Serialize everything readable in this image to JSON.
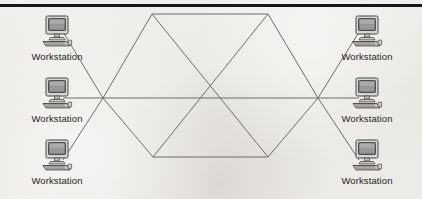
{
  "diagram": {
    "topology_type": "mesh",
    "background_color": "#eceae6",
    "line_color": "#6e6c6a",
    "rule_color": "#17171a",
    "label_color": "#1d1d20",
    "icon_name": "workstation-computer-icon",
    "nodes": [
      {
        "id": "ws-top-left",
        "label": "Workstation",
        "x": 20,
        "y": 14,
        "port_x": 63,
        "port_y": 32
      },
      {
        "id": "ws-middle-left",
        "label": "Workstation",
        "x": 20,
        "y": 76,
        "port_x": 63,
        "port_y": 98
      },
      {
        "id": "ws-bottom-left",
        "label": "Workstation",
        "x": 20,
        "y": 138,
        "port_x": 63,
        "port_y": 160
      },
      {
        "id": "ws-top-right",
        "label": "Workstation",
        "x": 330,
        "y": 14,
        "port_x": 359,
        "port_y": 32
      },
      {
        "id": "ws-middle-right",
        "label": "Workstation",
        "x": 330,
        "y": 76,
        "port_x": 359,
        "port_y": 98
      },
      {
        "id": "ws-bottom-right",
        "label": "Workstation",
        "x": 330,
        "y": 138,
        "port_x": 359,
        "port_y": 160
      }
    ],
    "hub_vertices": [
      {
        "id": "hub-top-left",
        "x": 152,
        "y": 14
      },
      {
        "id": "hub-top-right",
        "x": 268,
        "y": 14
      },
      {
        "id": "hub-right",
        "x": 318,
        "y": 98
      },
      {
        "id": "hub-bottom-right",
        "x": 268,
        "y": 157
      },
      {
        "id": "hub-bottom-left",
        "x": 153,
        "y": 157
      },
      {
        "id": "hub-left",
        "x": 103,
        "y": 98
      }
    ],
    "hub_edges": [
      {
        "from": "hub-top-left",
        "to": "hub-top-right"
      },
      {
        "from": "hub-top-right",
        "to": "hub-right"
      },
      {
        "from": "hub-right",
        "to": "hub-bottom-right"
      },
      {
        "from": "hub-bottom-right",
        "to": "hub-bottom-left"
      },
      {
        "from": "hub-bottom-left",
        "to": "hub-left"
      },
      {
        "from": "hub-left",
        "to": "hub-top-left"
      },
      {
        "from": "hub-top-left",
        "to": "hub-bottom-right"
      },
      {
        "from": "hub-top-right",
        "to": "hub-bottom-left"
      },
      {
        "from": "hub-left",
        "to": "hub-right"
      }
    ],
    "node_links": [
      {
        "from": "ws-top-left",
        "to": "hub-left"
      },
      {
        "from": "ws-middle-left",
        "to": "hub-left"
      },
      {
        "from": "ws-bottom-left",
        "to": "hub-left"
      },
      {
        "from": "ws-top-right",
        "to": "hub-right"
      },
      {
        "from": "ws-middle-right",
        "to": "hub-right"
      },
      {
        "from": "ws-bottom-right",
        "to": "hub-right"
      }
    ]
  }
}
